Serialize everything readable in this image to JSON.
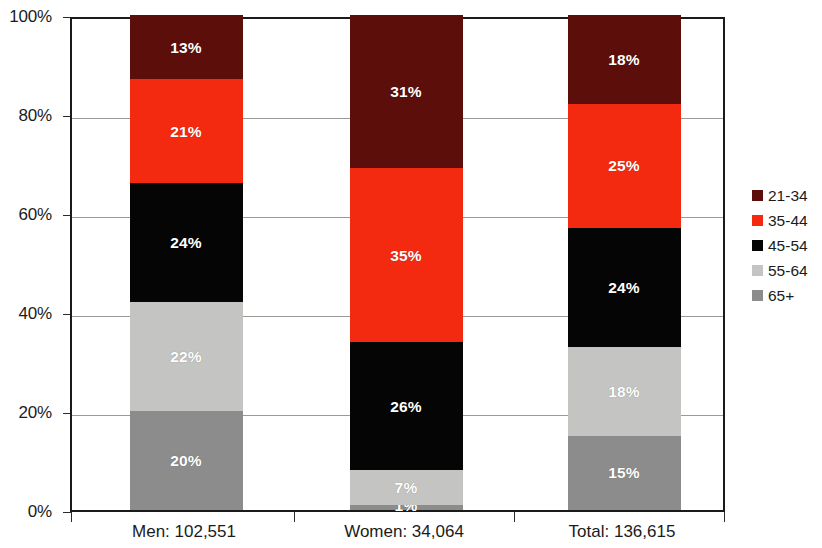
{
  "chart_data": {
    "type": "bar",
    "subtype": "stacked-100-percent",
    "title": "",
    "subtitle": "",
    "xlabel": "",
    "ylabel": "",
    "categories": [
      "Men: 102,551",
      "Women: 34,064",
      "Total: 136,615"
    ],
    "category_names": [
      "Men",
      "Women",
      "Total"
    ],
    "category_counts": [
      "102,551",
      "34,064",
      "136,615"
    ],
    "ylim": [
      0,
      100
    ],
    "y_tick_values": [
      0,
      20,
      40,
      60,
      80,
      100
    ],
    "y_tick_labels": [
      "0%",
      "20%",
      "40%",
      "60%",
      "80%",
      "100%"
    ],
    "grid": true,
    "grid_axis": "y",
    "legend_position": "right",
    "stack_order_bottom_to_top": [
      "65+",
      "55-64",
      "45-54",
      "35-44",
      "21-34"
    ],
    "series": [
      {
        "name": "21-34",
        "color": "#5C0F0A",
        "values": [
          13,
          31,
          18
        ],
        "labels": [
          "13%",
          "31%",
          "18%"
        ]
      },
      {
        "name": "35-44",
        "color": "#F32A10",
        "values": [
          21,
          35,
          25
        ],
        "labels": [
          "21%",
          "35%",
          "25%"
        ]
      },
      {
        "name": "45-54",
        "color": "#050505",
        "values": [
          24,
          26,
          24
        ],
        "labels": [
          "24%",
          "26%",
          "24%"
        ]
      },
      {
        "name": "55-64",
        "color": "#C4C4C2",
        "values": [
          22,
          7,
          18
        ],
        "labels": [
          "22%",
          "7%",
          "18%"
        ]
      },
      {
        "name": "65+",
        "color": "#8C8C8C",
        "values": [
          20,
          1,
          15
        ],
        "labels": [
          "20%",
          "1%",
          "15%"
        ]
      }
    ]
  },
  "legend": {
    "items": [
      {
        "label": "21-34",
        "color": "#5C0F0A"
      },
      {
        "label": "35-44",
        "color": "#F32A10"
      },
      {
        "label": "45-54",
        "color": "#050505"
      },
      {
        "label": "55-64",
        "color": "#C4C4C2"
      },
      {
        "label": "65+",
        "color": "#8C8C8C"
      }
    ]
  }
}
